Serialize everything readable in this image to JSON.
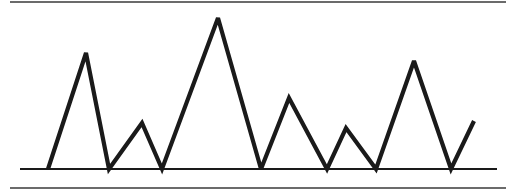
{
  "diagram": {
    "type": "line-waveform",
    "colors": {
      "background": "#ffffff",
      "stroke": "#1a1a1a",
      "rule": "#3a3a3a"
    },
    "top_rule": {
      "x1": 10,
      "x2": 506,
      "y": 2
    },
    "bottom_rule": {
      "x1": 10,
      "x2": 506,
      "y": 188
    },
    "baseline": {
      "x1": 20,
      "x2": 497,
      "y": 169
    },
    "waveform_points": [
      [
        48,
        169
      ],
      [
        86,
        53
      ],
      [
        109,
        169
      ],
      [
        142,
        123
      ],
      [
        162,
        169
      ],
      [
        218,
        18
      ],
      [
        261,
        169
      ],
      [
        289,
        98
      ],
      [
        327,
        169
      ],
      [
        346,
        128
      ],
      [
        376,
        169
      ],
      [
        414,
        61
      ],
      [
        451,
        169
      ],
      [
        474,
        121
      ]
    ],
    "peaks": [
      {
        "x": 86,
        "y": 53
      },
      {
        "x": 142,
        "y": 123
      },
      {
        "x": 218,
        "y": 18
      },
      {
        "x": 289,
        "y": 98
      },
      {
        "x": 346,
        "y": 128
      },
      {
        "x": 414,
        "y": 61
      },
      {
        "x": 474,
        "y": 121
      }
    ]
  }
}
